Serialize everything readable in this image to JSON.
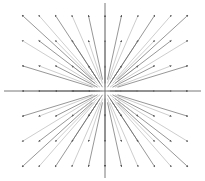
{
  "chart_data": {
    "type": "quiver",
    "title": "",
    "xlabel": "",
    "ylabel": "",
    "field": "F(x, y) = (x, y)",
    "grid": false,
    "axes_through_origin": true,
    "x_ticks": [
      -5,
      -4,
      -3,
      -2,
      -1,
      0,
      1,
      2,
      3,
      4,
      5
    ],
    "y_ticks": [
      -3,
      -2,
      -1,
      0,
      1,
      2,
      3
    ],
    "xlim": [
      -6,
      6
    ],
    "ylim": [
      -3.6,
      3.6
    ],
    "arrow_scale": 0.85,
    "vectors_note": "Each arrow at grid point (x, y) has direction (x, y); origin omitted",
    "colors": {
      "axis": "#555555",
      "arrow_dark": "#6a6a6a",
      "arrow_light": "#b8b8b8"
    }
  },
  "layout": {
    "origin_px": [
      105,
      91
    ],
    "x_unit_px": 16.6,
    "y_unit_px": 25.3
  }
}
